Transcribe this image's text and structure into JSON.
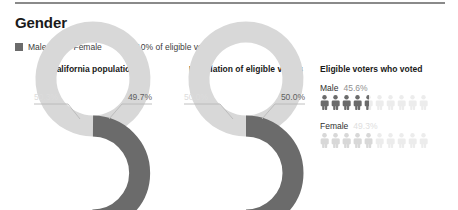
{
  "section": {
    "title": "Gender"
  },
  "legend": {
    "items": [
      {
        "label": "Male",
        "color": "#6b6b6b",
        "icon": "square-swatch-icon"
      },
      {
        "label": "Female",
        "color": "#d8d8d8",
        "icon": "square-swatch-icon"
      }
    ],
    "unit_icon": "person-icon",
    "unit_note": "= 10% of eligible voters"
  },
  "panels": {
    "california": {
      "title": "California population"
    },
    "eligible": {
      "title": "Population of eligible voters"
    },
    "voted": {
      "title": "Eligible voters who voted"
    }
  },
  "labels": {
    "california_female": "50.3%",
    "california_male": "49.7%",
    "eligible_female": "50.0%",
    "eligible_male": "50.0%",
    "voted_male_name": "Male",
    "voted_male_pct": "45.6%",
    "voted_female_name": "Female",
    "voted_female_pct": "49.3%"
  },
  "colors": {
    "male": "#6b6b6b",
    "female": "#d8d8d8",
    "male_text": "#5f5f5f",
    "female_text": "#dcdcdc",
    "rule": "#8a8a8a",
    "title": "#1a1a1a"
  },
  "chart_data": [
    {
      "type": "pie",
      "title": "California population",
      "variant": "donut",
      "categories": [
        "Male",
        "Female"
      ],
      "values": [
        49.7,
        50.3
      ],
      "labels": [
        "49.7%",
        "50.3%"
      ],
      "colors": [
        "#6b6b6b",
        "#d8d8d8"
      ],
      "legend": "top"
    },
    {
      "type": "pie",
      "title": "Population of eligible voters",
      "variant": "donut",
      "categories": [
        "Male",
        "Female"
      ],
      "values": [
        50.0,
        50.0
      ],
      "labels": [
        "50.0%",
        "50.0%"
      ],
      "colors": [
        "#6b6b6b",
        "#d8d8d8"
      ],
      "legend": "top"
    },
    {
      "type": "bar",
      "variant": "pictogram",
      "title": "Eligible voters who voted",
      "categories": [
        "Male",
        "Female"
      ],
      "values": [
        45.6,
        49.3
      ],
      "labels": [
        "45.6%",
        "49.3%"
      ],
      "unit_value": 10,
      "unit_label": "= 10% of eligible voters",
      "icons_per_row": 10,
      "colors": [
        "#6b6b6b",
        "#d8d8d8"
      ],
      "ylabel": "",
      "xlabel": ""
    }
  ]
}
